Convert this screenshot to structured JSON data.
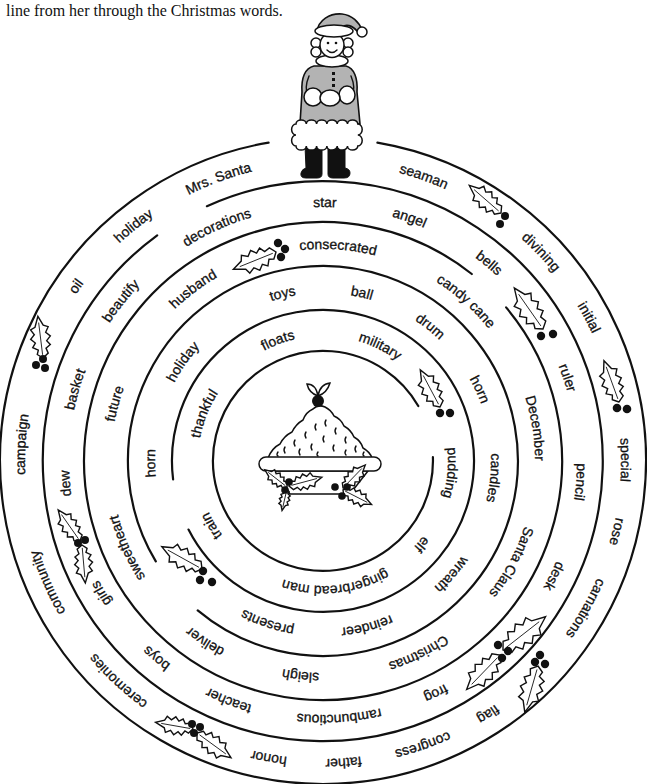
{
  "instructions": "line from her through the Christmas words.",
  "illustrations": {
    "start_figure": "mrs-santa",
    "goal_figure": "christmas-pudding",
    "ornament": "holly-sprig"
  },
  "colors": {
    "ink": "#111111",
    "paper": "#ffffff",
    "coat_gray": "#b3b3b3"
  },
  "maze": {
    "rings": {
      "outer": [
        "Mrs. Santa",
        "holiday",
        "oil",
        "campaign",
        "community",
        "ceremonies",
        "honor",
        "father",
        "congress",
        "flag",
        "carnations",
        "rose",
        "special",
        "initial",
        "divining",
        "seaman"
      ],
      "second": [
        "star",
        "decorations",
        "beautify",
        "basket",
        "dew",
        "girls",
        "boys",
        "teacher",
        "rambunctious",
        "frog",
        "desk",
        "pencil",
        "ruler",
        "bells",
        "angel"
      ],
      "third": [
        "consecrated",
        "husband",
        "future",
        "sweetheart",
        "deliver",
        "sleigh",
        "Christmas",
        "Santa Claus",
        "December",
        "candy cane"
      ],
      "fourth": [
        "toys",
        "ball",
        "drum",
        "horn",
        "candles",
        "wreath",
        "reindeer",
        "presents",
        "horn",
        "holiday"
      ],
      "inner": [
        "floats",
        "military",
        "pudding",
        "elf",
        "gingerbread man",
        "train",
        "thankful"
      ]
    }
  }
}
